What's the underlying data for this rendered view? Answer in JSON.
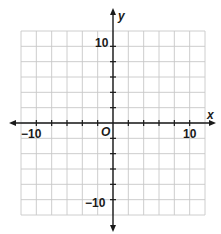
{
  "chart_data": {
    "type": "scatter",
    "title": "",
    "xlabel": "x",
    "ylabel": "y",
    "origin_label": "O",
    "xlim": [
      -12,
      12
    ],
    "ylim": [
      -12,
      12
    ],
    "grid": true,
    "grid_step": 2,
    "tick_step": 2,
    "x_tick_labels": [
      {
        "value": -10,
        "label": "−10"
      },
      {
        "value": 10,
        "label": "10"
      }
    ],
    "y_tick_labels": [
      {
        "value": 10,
        "label": "10"
      },
      {
        "value": -10,
        "label": "−10"
      }
    ],
    "series": [],
    "legend": null
  },
  "colors": {
    "grid": "#c8c8c8",
    "axis": "#1a1a1a",
    "background": "#ffffff"
  },
  "labels": {
    "x_axis": "x",
    "y_axis": "y",
    "origin": "O",
    "x_neg10": "−10",
    "x_pos10": "10",
    "y_pos10": "10",
    "y_neg10": "−10"
  }
}
